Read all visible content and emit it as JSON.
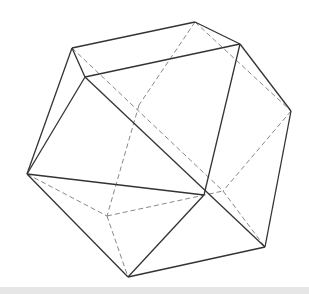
{
  "diagram": {
    "type": "polyhedron-wireframe",
    "vertices": {
      "A": [
        72,
        48
      ],
      "B": [
        85,
        77
      ],
      "C": [
        195,
        22
      ],
      "D": [
        240,
        44
      ],
      "E": [
        291,
        111
      ],
      "F": [
        27,
        174
      ],
      "G": [
        204,
        195
      ],
      "H": [
        265,
        247
      ],
      "I": [
        128,
        277
      ],
      "P": [
        139,
        105
      ],
      "J": [
        107,
        216
      ],
      "K": [
        223,
        191
      ]
    },
    "solid_edges": [
      [
        "A",
        "C"
      ],
      [
        "C",
        "D"
      ],
      [
        "A",
        "B"
      ],
      [
        "B",
        "D"
      ],
      [
        "A",
        "F"
      ],
      [
        "B",
        "F"
      ],
      [
        "B",
        "H"
      ],
      [
        "D",
        "E"
      ],
      [
        "D",
        "G"
      ],
      [
        "E",
        "H"
      ],
      [
        "F",
        "I"
      ],
      [
        "G",
        "I"
      ],
      [
        "H",
        "I"
      ],
      [
        "G",
        "F"
      ]
    ],
    "dashed_edges": [
      [
        "A",
        "K"
      ],
      [
        "C",
        "P"
      ],
      [
        "P",
        "J"
      ],
      [
        "C",
        "E"
      ],
      [
        "F",
        "J"
      ],
      [
        "J",
        "I"
      ],
      [
        "J",
        "K"
      ],
      [
        "E",
        "K"
      ],
      [
        "K",
        "H"
      ]
    ],
    "colors": {
      "solid": "#333333",
      "dashed": "#888888",
      "band": "#e6e6e6"
    }
  }
}
